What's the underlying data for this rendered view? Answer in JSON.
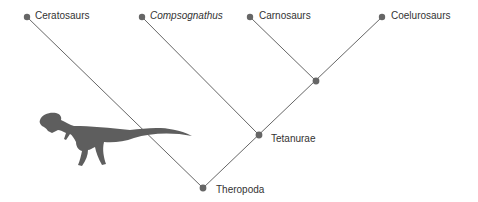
{
  "diagram": {
    "type": "cladogram",
    "colors": {
      "line": "#555555",
      "node": "#666666",
      "silhouette": "#5e5e5e",
      "text": "#333333"
    },
    "taxa": [
      {
        "label": "Ceratosaurs",
        "italic": false
      },
      {
        "label": "Compsognathus",
        "italic": true
      },
      {
        "label": "Carnosaurs",
        "italic": false
      },
      {
        "label": "Coelurosaurs",
        "italic": false
      }
    ],
    "nodes": [
      {
        "label": "Tetanurae"
      },
      {
        "label": "Theropoda"
      }
    ],
    "illustration": "theropod-dinosaur-silhouette"
  }
}
